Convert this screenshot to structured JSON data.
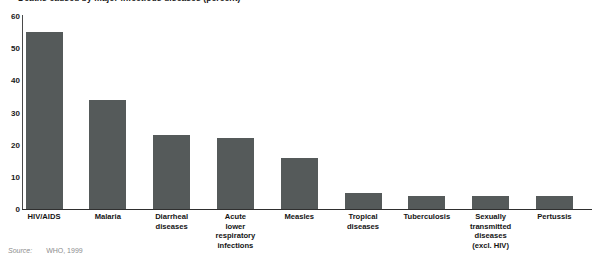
{
  "chart_data": {
    "type": "bar",
    "title": "Deaths caused by major infectious diseases (percent)",
    "xlabel": "",
    "ylabel": "",
    "ylim": [
      0,
      60
    ],
    "yticks": [
      0,
      10,
      20,
      30,
      40,
      50,
      60
    ],
    "ytick_labels": [
      "0",
      "10",
      "20",
      "30",
      "40",
      "50",
      "60"
    ],
    "grid": false,
    "legend": "none",
    "bar_color": "#555a5a",
    "axis_color": "#2f2f2f",
    "categories": [
      "HIV/AIDS",
      "Malaria",
      "Diarrheal diseases",
      "Acute lower respiratory infections",
      "Measles",
      "Tropical diseases",
      "Tuberculosis",
      "Sexually transmitted diseases (excl. HIV)",
      "Pertussis"
    ],
    "category_lines": [
      [
        "HIV/AIDS"
      ],
      [
        "Malaria"
      ],
      [
        "Diarrheal",
        "diseases"
      ],
      [
        "Acute",
        "lower",
        "respiratory",
        "infections"
      ],
      [
        "Measles"
      ],
      [
        "Tropical",
        "diseases"
      ],
      [
        "Tuberculosis"
      ],
      [
        "Sexually",
        "transmitted",
        "diseases",
        "(excl. HIV)"
      ],
      [
        "Pertussis"
      ]
    ],
    "values": [
      55,
      34,
      23,
      22,
      16,
      5,
      4,
      4,
      4
    ]
  },
  "source": {
    "label": "Source:",
    "text": "WHO, 1999"
  }
}
